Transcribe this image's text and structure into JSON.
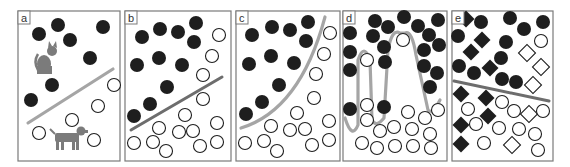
{
  "figure": {
    "colors": {
      "filled_marker": "#1e1e1e",
      "open_marker_stroke": "#1e1e1e",
      "boundary": "#a5a5a5",
      "boundary_dark": "#6d6d6d",
      "frame": "#7a7a7a",
      "animal": "#7b7b7b"
    },
    "panels": [
      {
        "id": "a",
        "label": "a",
        "boundary": "linear",
        "illustration": [
          "cat-icon",
          "dog-icon"
        ]
      },
      {
        "id": "b",
        "label": "b",
        "boundary": "linear"
      },
      {
        "id": "c",
        "label": "c",
        "boundary": "curved"
      },
      {
        "id": "d",
        "label": "d",
        "boundary": "overfit-wiggly"
      },
      {
        "id": "e",
        "label": "e",
        "boundary": "linear",
        "extra_class_shapes": [
          "filled-diamond",
          "open-diamond"
        ]
      }
    ]
  }
}
